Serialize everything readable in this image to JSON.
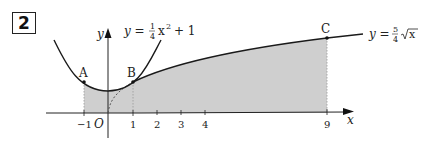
{
  "problem_number": "2",
  "axes": {
    "x_label": "x",
    "y_label": "y",
    "origin_label": "O",
    "x_ticks": [
      "−1",
      "1",
      "2",
      "3",
      "4",
      "9"
    ]
  },
  "curves": [
    {
      "name": "parabola",
      "equation_lhs": "y =",
      "frac_num": "1",
      "frac_den": "4",
      "var": "x",
      "exp": "2",
      "rest": "+ 1"
    },
    {
      "name": "root",
      "equation_lhs": "y =",
      "frac_num": "5",
      "frac_den": "4",
      "radicand": "x"
    }
  ],
  "points": [
    {
      "label": "A"
    },
    {
      "label": "B"
    },
    {
      "label": "C"
    }
  ],
  "colors": {
    "shade": "#cfcfcf",
    "curve": "#1a1a1a",
    "axis": "#222222"
  }
}
